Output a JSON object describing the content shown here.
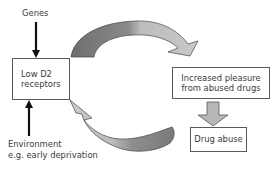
{
  "diagram": {
    "inputs": {
      "genes": "Genes",
      "environment_line1": "Environment",
      "environment_line2": "e.g. early deprivation"
    },
    "boxes": {
      "low_d2": {
        "line1": "Low D2",
        "line2": "receptors"
      },
      "pleasure": {
        "line1": "Increased pleasure",
        "line2": "from abused drugs"
      },
      "drug_abuse": {
        "label": "Drug abuse"
      }
    },
    "colors": {
      "arrow_dark": "#7a7a7a",
      "arrow_light": "#c4c4c4",
      "arrow_stroke": "#444444",
      "box_border": "#5a5a5a",
      "text": "#3a3a3a",
      "input_arrow": "#111111"
    },
    "flows": [
      {
        "from": "Genes",
        "to": "Low D2 receptors",
        "style": "black-arrow"
      },
      {
        "from": "Environment e.g. early deprivation",
        "to": "Low D2 receptors",
        "style": "black-arrow"
      },
      {
        "from": "Low D2 receptors",
        "to": "Increased pleasure from abused drugs",
        "style": "curved-grey-arrow"
      },
      {
        "from": "Increased pleasure from abused drugs",
        "to": "Drug abuse",
        "style": "block-grey-arrow"
      },
      {
        "from": "Drug abuse",
        "to": "Low D2 receptors",
        "style": "curved-grey-arrow"
      }
    ]
  }
}
